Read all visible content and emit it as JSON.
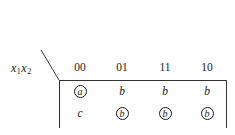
{
  "diagram": {
    "type": "state-table",
    "corner_label": {
      "var1": "x",
      "sub1": "1",
      "var2": "x",
      "sub2": "2"
    },
    "columns": [
      "00",
      "01",
      "11",
      "10"
    ],
    "rows": [
      [
        {
          "value": "a",
          "circled": true
        },
        {
          "value": "b",
          "circled": false
        },
        {
          "value": "b",
          "circled": false
        },
        {
          "value": "b",
          "circled": false
        }
      ],
      [
        {
          "value": "c",
          "circled": false
        },
        {
          "value": "b",
          "circled": true
        },
        {
          "value": "b",
          "circled": true
        },
        {
          "value": "b",
          "circled": true
        }
      ]
    ]
  }
}
